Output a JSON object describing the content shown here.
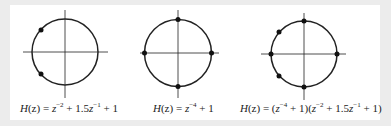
{
  "figure": {
    "colors": {
      "background": "#ececec",
      "panel": "#ffffff",
      "stroke": "#222222"
    },
    "plots": [
      {
        "id": "plot-1",
        "zeros_angles_deg": [
          138.6,
          -138.6
        ],
        "equation": {
          "lhs": "H(z)",
          "rhs_text": "z^-2 + 1.5z^-1 + 1",
          "parts": [
            {
              "t": "H",
              "i": true
            },
            {
              "t": "(z) = "
            },
            {
              "t": "z",
              "i": true
            },
            {
              "t": "−2",
              "sup": true
            },
            {
              "t": " + 1.5"
            },
            {
              "t": "z",
              "i": true
            },
            {
              "t": "−1",
              "sup": true
            },
            {
              "t": " + 1"
            }
          ]
        }
      },
      {
        "id": "plot-2",
        "zeros_angles_deg": [
          0,
          90,
          180,
          270
        ],
        "equation": {
          "lhs": "H(z)",
          "rhs_text": "z^-4 + 1",
          "parts": [
            {
              "t": "H",
              "i": true
            },
            {
              "t": "(z) = "
            },
            {
              "t": "z",
              "i": true
            },
            {
              "t": "−4",
              "sup": true
            },
            {
              "t": " + 1"
            }
          ]
        }
      },
      {
        "id": "plot-3",
        "zeros_angles_deg": [
          0,
          90,
          138.6,
          180,
          221.4,
          270
        ],
        "equation": {
          "lhs": "H(z)",
          "rhs_text": "(z^-4 + 1)(z^-2 + 1.5z^-1 + 1)",
          "parts": [
            {
              "t": "H",
              "i": true
            },
            {
              "t": "(z) = ("
            },
            {
              "t": "z",
              "i": true
            },
            {
              "t": "−4",
              "sup": true
            },
            {
              "t": " + 1)("
            },
            {
              "t": "z",
              "i": true
            },
            {
              "t": "−2",
              "sup": true
            },
            {
              "t": " + 1.5"
            },
            {
              "t": "z",
              "i": true
            },
            {
              "t": "−1",
              "sup": true
            },
            {
              "t": " + 1)"
            }
          ]
        }
      }
    ]
  },
  "labels": {
    "eq1": "H(z) = z^-2 + 1.5z^-1 + 1",
    "eq2": "H(z) = z^-4 + 1",
    "eq3": "H(z) = (z^-4 + 1)(z^-2 + 1.5z^-1 + 1)"
  }
}
